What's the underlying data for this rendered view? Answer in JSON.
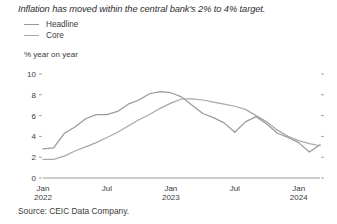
{
  "chart_data": {
    "type": "line",
    "title": "Inflation has moved within the central bank's 2% to 4% target.",
    "ylabel": "% year on year",
    "xlabel": "",
    "ylim": [
      0,
      10
    ],
    "yticks": [
      0,
      2,
      4,
      6,
      8,
      10
    ],
    "ytick_labels": [
      "0",
      "2",
      "4",
      "6",
      "8",
      "10"
    ],
    "grid": false,
    "legend_position": "top-left",
    "x": [
      "2022-01",
      "2022-02",
      "2022-03",
      "2022-04",
      "2022-05",
      "2022-06",
      "2022-07",
      "2022-08",
      "2022-09",
      "2022-10",
      "2022-11",
      "2022-12",
      "2023-01",
      "2023-02",
      "2023-03",
      "2023-04",
      "2023-05",
      "2023-06",
      "2023-07",
      "2023-08",
      "2023-09",
      "2023-10",
      "2023-11",
      "2023-12",
      "2024-01",
      "2024-02",
      "2024-03"
    ],
    "xtick_positions": [
      0,
      6,
      12,
      18,
      24
    ],
    "xtick_labels": [
      "Jan",
      "Jul",
      "Jan",
      "Jul",
      "Jan"
    ],
    "xtick_sublabels": [
      "2022",
      "",
      "2023",
      "",
      "2024"
    ],
    "series": [
      {
        "name": "Headline",
        "color": "#9a9a9a",
        "values": [
          2.8,
          2.9,
          4.3,
          4.9,
          5.7,
          6.1,
          6.1,
          6.4,
          7.1,
          7.5,
          8.1,
          8.3,
          8.2,
          7.8,
          7.0,
          6.2,
          5.8,
          5.3,
          4.4,
          5.4,
          5.9,
          5.2,
          4.3,
          3.9,
          3.4,
          2.5,
          3.2
        ]
      },
      {
        "name": "Core",
        "color": "#a8a8a8",
        "values": [
          1.8,
          1.8,
          2.1,
          2.6,
          3.0,
          3.4,
          3.9,
          4.4,
          5.0,
          5.6,
          6.1,
          6.7,
          7.2,
          7.6,
          7.6,
          7.5,
          7.3,
          7.1,
          6.9,
          6.6,
          6.0,
          5.4,
          4.6,
          4.0,
          3.6,
          3.3,
          3.1
        ]
      }
    ],
    "source": "Source: CEIC Data Company."
  },
  "legend": {
    "items": [
      {
        "label": "Headline"
      },
      {
        "label": "Core"
      }
    ]
  }
}
